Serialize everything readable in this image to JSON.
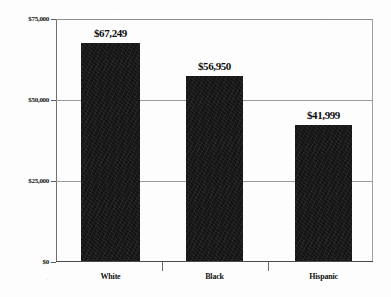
{
  "chart_data": {
    "type": "bar",
    "title": "",
    "subtitle": "",
    "xlabel": "",
    "ylabel": "",
    "categories": [
      "White",
      "Black",
      "Hispanic"
    ],
    "values": [
      67249,
      56950,
      41999
    ],
    "value_labels": [
      "$67,249",
      "$56,950",
      "$41,999"
    ],
    "ylim": [
      0,
      75000
    ],
    "yticks": [
      0,
      25000,
      50000,
      75000
    ],
    "ytick_labels": [
      "$0",
      "$25,000",
      "$50,000",
      "$75,000"
    ],
    "grid": true,
    "gridlines_at": [
      25000,
      50000
    ],
    "legend": "none",
    "bar_color": "#141414",
    "axis_color": "#6f6f6f",
    "grid_color": "#9b9b9b",
    "background": "#fdfdfd"
  }
}
